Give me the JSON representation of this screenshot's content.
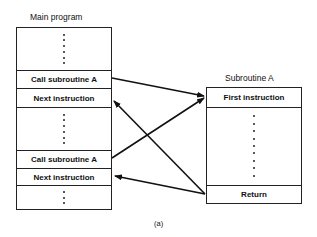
{
  "main_program": {
    "title": "Main program",
    "rows": [
      {
        "type": "dots",
        "count": 6
      },
      {
        "type": "text",
        "label": "Call subroutine A"
      },
      {
        "type": "text",
        "label": "Next instruction"
      },
      {
        "type": "dots",
        "count": 6
      },
      {
        "type": "text",
        "label": "Call subroutine A"
      },
      {
        "type": "text",
        "label": "Next instruction"
      },
      {
        "type": "dots",
        "count": 3
      }
    ]
  },
  "subroutine": {
    "title": "Subroutine A",
    "rows": [
      {
        "type": "text",
        "label": "First instruction"
      },
      {
        "type": "dots",
        "count": 9
      },
      {
        "type": "text",
        "label": "Return"
      }
    ]
  },
  "arrows": [
    {
      "from": "Call subroutine A (1)",
      "to": "First instruction"
    },
    {
      "from": "Call subroutine A (2)",
      "to": "First instruction"
    },
    {
      "from": "Return",
      "to": "Next instruction (1)"
    },
    {
      "from": "Return",
      "to": "Next instruction (2)"
    }
  ],
  "caption": "(a)"
}
